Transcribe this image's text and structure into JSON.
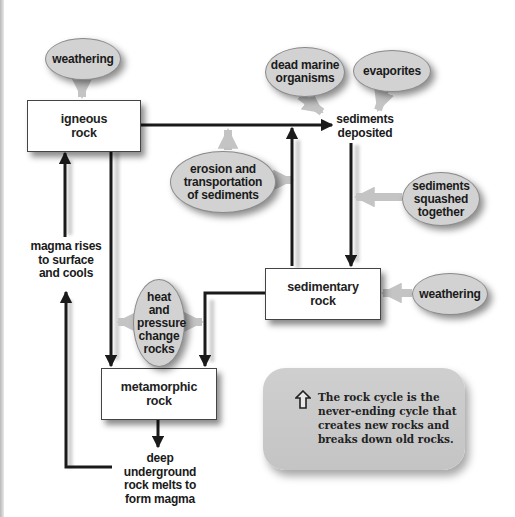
{
  "diagram": {
    "title": "The rock cycle",
    "boxes": {
      "igneous": "igneous rock",
      "sedimentary": "sedimentary rock",
      "metamorphic": "metamorphic rock"
    },
    "processes": {
      "weathering_top": "weathering",
      "dead_marine": "dead marine organisms",
      "evaporites": "evaporites",
      "erosion": "erosion and transportation of sediments",
      "squashed": "sediments squashed together",
      "weathering_right": "weathering",
      "heat_pressure": "heat and pressure change rocks"
    },
    "labels": {
      "sediments_deposited": "sediments deposited",
      "magma_rises": "magma rises to surface and cools",
      "deep_underground": "deep underground rock melts to form magma"
    },
    "callout": {
      "icon": "up-arrow-outline-icon",
      "text": "The rock cycle is the never-ending cycle that creates new rocks and breaks down old rocks."
    },
    "colors": {
      "ellipse_fill": "#d2d2d2",
      "arrow_dark": "#1a1a1a",
      "arrow_light": "#c8c8c8",
      "callout_fill": "#cbcbcb"
    }
  }
}
